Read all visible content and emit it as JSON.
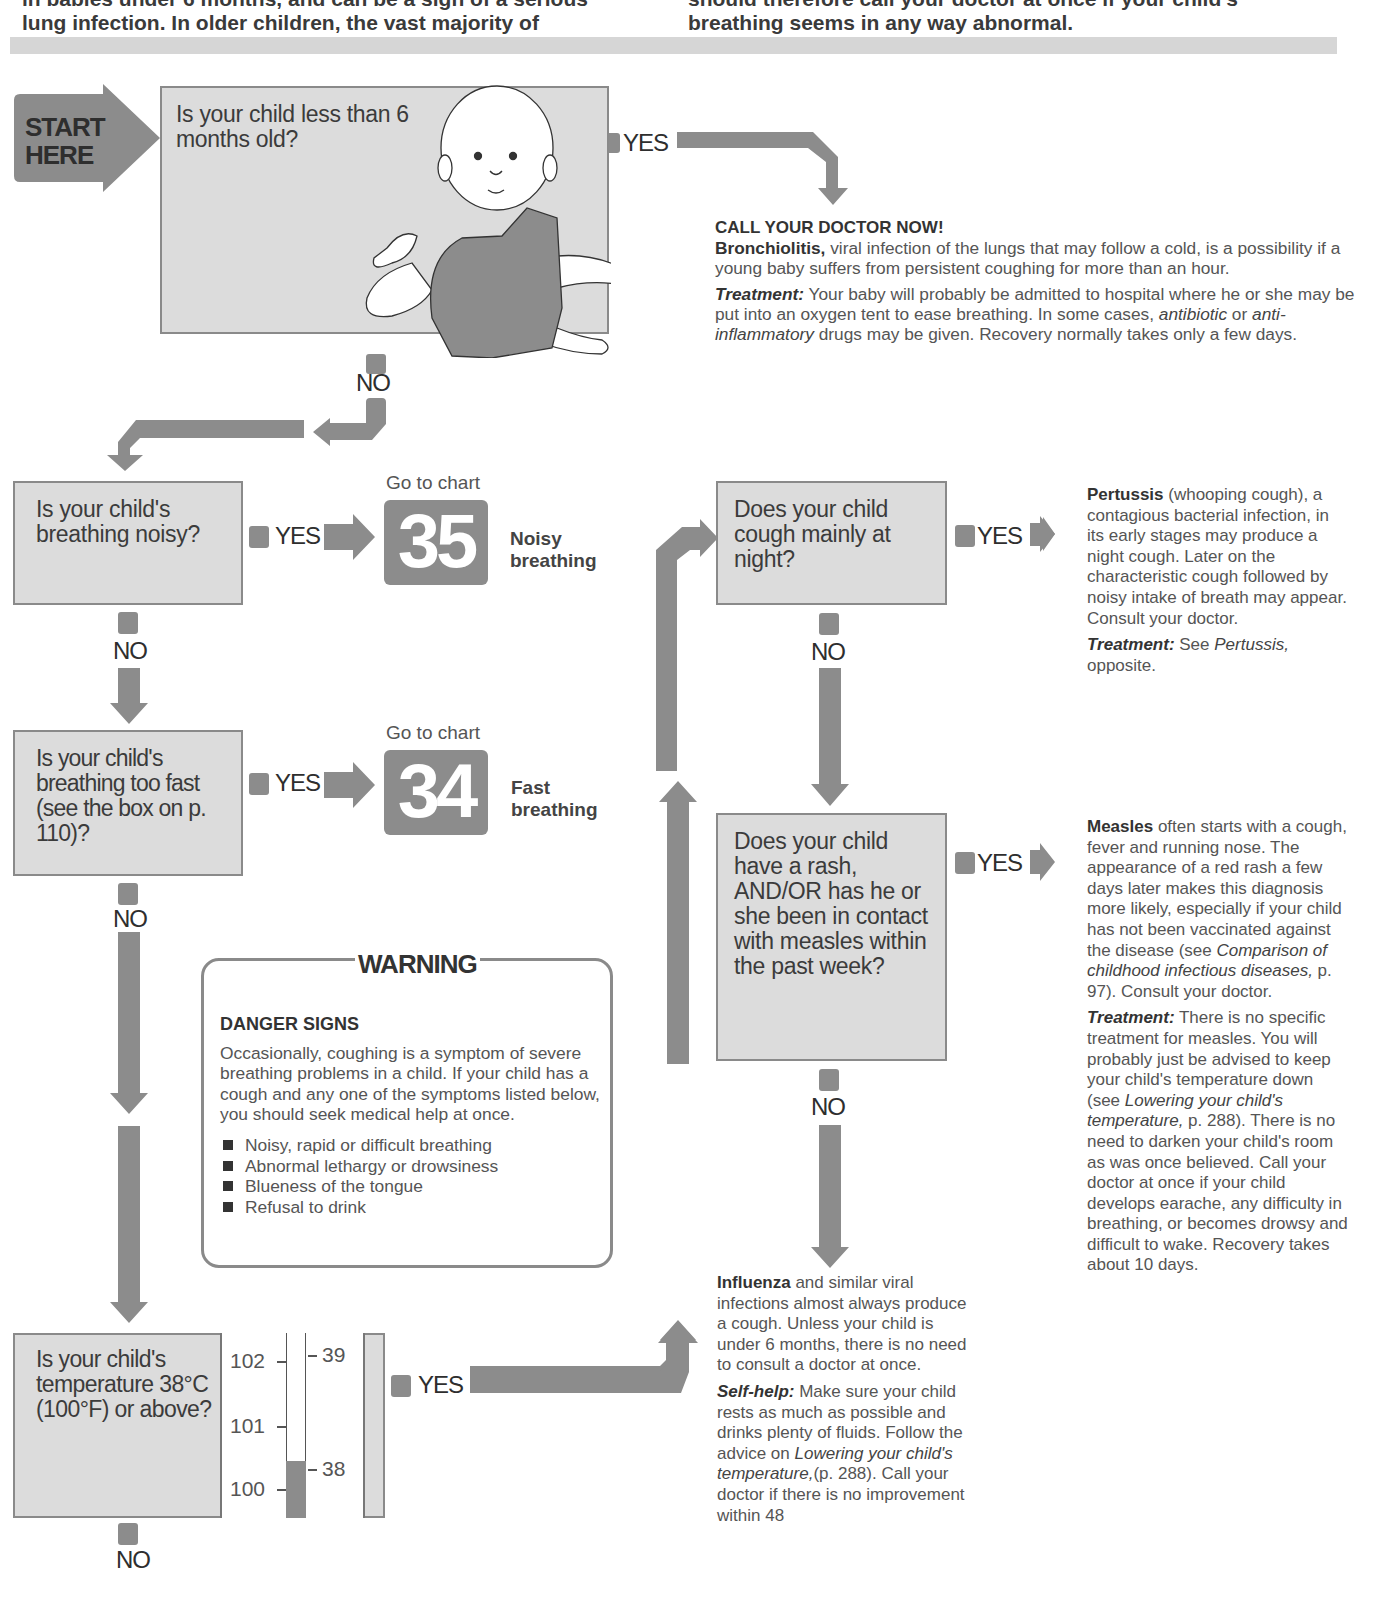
{
  "intro": {
    "left_partial_line": "in babies under 6 months, and can be a sign of a serious",
    "left_line": "lung infection. In older children, the vast majority of",
    "right_partial_line": "should therefore call your doctor at once if your child's",
    "right_line": "breathing seems in any way abnormal."
  },
  "start": {
    "line1": "START",
    "line2": "HERE"
  },
  "labels": {
    "yes": "YES",
    "no": "NO",
    "go_to_chart": "Go to chart"
  },
  "questions": {
    "q1": "Is your child less than 6 months old?",
    "q2": "Is your child's breathing noisy?",
    "q3": "Is your child's breathing too fast (see the box on p. 110)?",
    "q4": "Is your child's temperature 38°C (100°F) or above?",
    "q5": "Does your child cough mainly at night?",
    "q6": "Does your child have a rash, AND/OR has he or she been in contact with measles within the past week?"
  },
  "charts": [
    {
      "number": "35",
      "name_line1": "Noisy",
      "name_line2": "breathing"
    },
    {
      "number": "34",
      "name_line1": "Fast",
      "name_line2": "breathing"
    }
  ],
  "thermometer": {
    "fahrenheit_ticks": [
      "102",
      "101",
      "100"
    ],
    "celsius_ticks": [
      "39",
      "38"
    ]
  },
  "bronchiolitis": {
    "heading": "CALL YOUR DOCTOR NOW!",
    "name": "Bronchiolitis,",
    "description": " viral infection of the lungs that may follow a cold, is a possibility if a young baby suffers from persistent coughing for more than an hour.",
    "treatment_label": "Treatment:",
    "treatment_a": " Your baby will probably be admitted to hospital where he or she may be put into an oxygen tent to ease breathing. In some cases, ",
    "treatment_i1": "antibiotic",
    "treatment_b": " or ",
    "treatment_i2": "anti-inflammatory",
    "treatment_c": " drugs may be given. Recovery normally takes only a few days."
  },
  "pertussis": {
    "name": "Pertussis",
    "description": " (whooping cough), a contagious bacterial infection, in its early stages may produce a night cough. Later on the characteristic cough followed by noisy intake of breath may appear. Consult your doctor.",
    "treatment_label": "Treatment:",
    "treatment_a": " See ",
    "treatment_i": "Pertussis,",
    "treatment_b": " opposite."
  },
  "measles": {
    "name": "Measles",
    "description_a": " often starts with a cough, fever and running nose. The appearance of a red rash a few days later makes this diagnosis more likely, especially if your child has not been vaccinated against the disease (see ",
    "description_i": "Comparison of childhood infectious diseases,",
    "description_b": " p. 97). Consult your doctor.",
    "treatment_label": "Treatment:",
    "treatment_a": " There is no specific treatment for measles. You will probably just be advised to keep your child's temperature down (see ",
    "treatment_i": "Lowering your child's temperature,",
    "treatment_b": " p. 288). There is no need to darken your child's room as was once believed. Call your doctor at once if your child develops earache, any difficulty in breathing, or becomes drowsy and difficult to wake. Recovery takes about 10 days."
  },
  "influenza": {
    "name": "Influenza",
    "description": " and similar viral infections almost always produce a cough. Unless your child is under 6 months, there is no need to consult a doctor at once.",
    "selfhelp_label": "Self-help:",
    "selfhelp_a": " Make sure your child rests as much as possible and drinks plenty of fluids. Follow the advice on ",
    "selfhelp_i": "Lowering your child's temperature,",
    "selfhelp_b": "(p. 288). Call your doctor if there is no improvement within 48"
  },
  "warning": {
    "title": "WARNING",
    "heading": "DANGER SIGNS",
    "body": "Occasionally, coughing is a symptom of severe breathing problems in a child. If your child has a cough and any one of the symptoms listed below, you should seek medical help at once.",
    "items": [
      "Noisy, rapid or difficult breathing",
      "Abnormal lethargy or drowsiness",
      "Blueness of the tongue",
      "Refusal to drink"
    ]
  },
  "colors": {
    "arrow_gray": "#8c8c8c",
    "box_fill": "#dcdcdc",
    "box_border": "#8a8a8a",
    "text_dark": "#333333"
  }
}
